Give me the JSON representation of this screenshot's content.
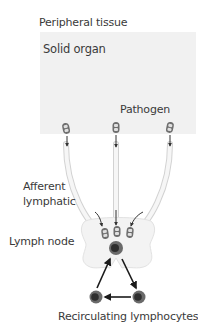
{
  "labels": {
    "peripheral_tissue": "Peripheral tissue",
    "solid_organ": "Solid organ",
    "pathogen": "Pathogen",
    "afferent_lymphatic_line1": "Afferent",
    "afferent_lymphatic_line2": "lymphatic",
    "lymph_node": "Lymph node",
    "recirculating_lymphocytes": "Recirculating lymphocytes"
  },
  "colors": {
    "panel_fill": "#f1f1f1",
    "vessel_fill": "#f4f4f4",
    "vessel_stroke": "#d2d2d2",
    "node_fill": "#f3f3f3",
    "pathogen_fill": "#6e6e6e",
    "lymphocyte_outer": "#6a6a6a",
    "lymphocyte_inner": "#2e2e2e",
    "arrow": "#1a1a1a",
    "text": "#3a3a3a"
  },
  "elements": {
    "pathogens_in_tissue": 3,
    "pathogens_in_node": 3,
    "lymphocytes": 3
  }
}
